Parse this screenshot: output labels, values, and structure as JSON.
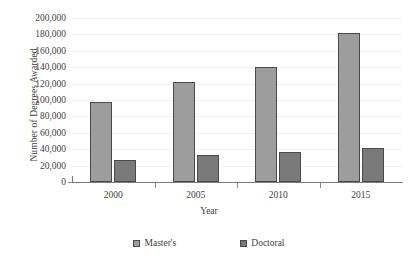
{
  "chart_data": {
    "type": "bar",
    "title": "",
    "subtitle": "",
    "xlabel": "Year",
    "ylabel": "Number of Degrees Awarded",
    "categories": [
      "2000",
      "2005",
      "2010",
      "2015"
    ],
    "series": [
      {
        "name": "Master's",
        "values": [
          97000,
          122000,
          140000,
          182000
        ],
        "color": "#9d9d9d"
      },
      {
        "name": "Doctoral",
        "values": [
          27000,
          33000,
          36000,
          42000
        ],
        "color": "#7a7a7a"
      }
    ],
    "ylim": [
      0,
      200000
    ],
    "ytick_step": 20000,
    "ytick_labels": [
      "0",
      "20,000",
      "40,000",
      "60,000",
      "80,000",
      "100,000",
      "120,000",
      "140,000",
      "160,000",
      "180,000",
      "200,000"
    ],
    "ytick_values": [
      0,
      20000,
      40000,
      60000,
      80000,
      100000,
      120000,
      140000,
      160000,
      180000,
      200000
    ],
    "grid": true,
    "grid_color": "#f1f1f1",
    "legend_position": "bottom",
    "axis_color": "#7c7c7c",
    "bar_border_color": "#4a4a4a",
    "background": "#ffffff"
  }
}
